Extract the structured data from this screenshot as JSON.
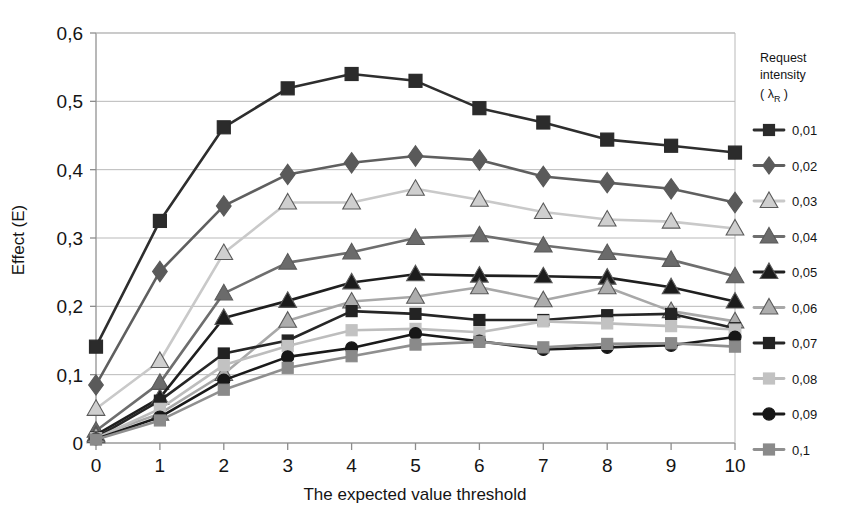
{
  "chart_data": {
    "type": "line",
    "title": "",
    "xlabel": "The expected value threshold",
    "ylabel": "Effect (E)",
    "x": [
      0,
      1,
      2,
      3,
      4,
      5,
      6,
      7,
      8,
      9,
      10
    ],
    "xtick_labels": [
      "0",
      "1",
      "2",
      "3",
      "4",
      "5",
      "6",
      "7",
      "8",
      "9",
      "10"
    ],
    "ytick_labels": [
      "0",
      "0,1",
      "0,2",
      "0,3",
      "0,4",
      "0,5",
      "0,6"
    ],
    "ytick_values": [
      0,
      0.1,
      0.2,
      0.3,
      0.4,
      0.5,
      0.6
    ],
    "xlim": [
      0,
      10
    ],
    "ylim": [
      0,
      0.6
    ],
    "grid": "horizontal",
    "legend_position": "right",
    "legend_title": "Request intensity",
    "legend_title_symbol": "( λ",
    "legend_title_sub": "R",
    "legend_title_close": " )",
    "decimal_separator": "comma",
    "series": [
      {
        "name": "0,01",
        "marker": "square",
        "color": "#2e2e2e",
        "marker_color": "#2b2b2b",
        "values": [
          0.141,
          0.325,
          0.462,
          0.519,
          0.54,
          0.53,
          0.49,
          0.469,
          0.444,
          0.435,
          0.425
        ]
      },
      {
        "name": "0,02",
        "marker": "diamond",
        "color": "#5f5f5f",
        "marker_color": "#5a5a5a",
        "values": [
          0.085,
          0.251,
          0.347,
          0.393,
          0.41,
          0.42,
          0.414,
          0.39,
          0.381,
          0.372,
          0.352
        ]
      },
      {
        "name": "0,03",
        "marker": "triangle",
        "color": "#c9c9c9",
        "marker_color": "#cfcfcf",
        "values": [
          0.05,
          0.12,
          0.278,
          0.352,
          0.352,
          0.372,
          0.356,
          0.338,
          0.327,
          0.324,
          0.314
        ]
      },
      {
        "name": "0,04",
        "marker": "triangle",
        "color": "#6e6e6e",
        "marker_color": "#6b6b6b",
        "values": [
          0.018,
          0.088,
          0.219,
          0.264,
          0.279,
          0.3,
          0.304,
          0.289,
          0.278,
          0.268,
          0.244
        ]
      },
      {
        "name": "0,05",
        "marker": "triangle",
        "color": "#1f1f1f",
        "marker_color": "#1c1c1c",
        "values": [
          0.012,
          0.066,
          0.183,
          0.208,
          0.235,
          0.247,
          0.245,
          0.244,
          0.242,
          0.228,
          0.207
        ]
      },
      {
        "name": "0,06",
        "marker": "triangle",
        "color": "#a8a8a8",
        "marker_color": "#adadad",
        "values": [
          0.01,
          0.043,
          0.101,
          0.179,
          0.207,
          0.214,
          0.228,
          0.209,
          0.228,
          0.193,
          0.178
        ]
      },
      {
        "name": "0,07",
        "marker": "square",
        "color": "#262626",
        "marker_color": "#232323",
        "values": [
          0.008,
          0.062,
          0.131,
          0.15,
          0.193,
          0.189,
          0.18,
          0.18,
          0.187,
          0.189,
          0.168
        ]
      },
      {
        "name": "0,08",
        "marker": "square",
        "color": "#bdbdbd",
        "marker_color": "#c2c2c2",
        "values": [
          0.007,
          0.05,
          0.114,
          0.142,
          0.165,
          0.167,
          0.162,
          0.178,
          0.175,
          0.171,
          0.166
        ]
      },
      {
        "name": "0,09",
        "marker": "circle",
        "color": "#1a1a1a",
        "marker_color": "#171717",
        "values": [
          0.006,
          0.038,
          0.092,
          0.126,
          0.139,
          0.16,
          0.149,
          0.137,
          0.14,
          0.143,
          0.155
        ]
      },
      {
        "name": "0,1",
        "marker": "square",
        "color": "#8f8f8f",
        "marker_color": "#8a8a8a",
        "values": [
          0.005,
          0.033,
          0.078,
          0.11,
          0.127,
          0.144,
          0.148,
          0.14,
          0.145,
          0.146,
          0.141
        ]
      }
    ]
  }
}
